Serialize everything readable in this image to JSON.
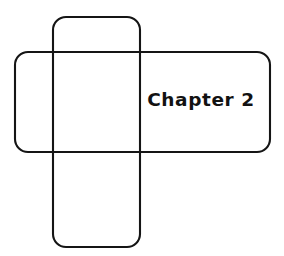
{
  "figure": {
    "title": "Chapter 2",
    "background_color": "#ffffff",
    "stroke_color": "#151515",
    "text_color": "#121212",
    "stroke_width": 2.1,
    "canvas": {
      "width": 284,
      "height": 256
    },
    "label": {
      "text": "Chapter 2",
      "x": 201,
      "y": 100,
      "font_size": 18.5,
      "font_weight": "bold",
      "align": "center"
    },
    "shapes": [
      {
        "name": "vertical-rounded-rectangle",
        "role": "vertical-band",
        "x": 53,
        "y": 17,
        "width": 87,
        "height": 230,
        "corner_radius": 13,
        "fill": "none",
        "stroke": "#151515"
      },
      {
        "name": "horizontal-rounded-rectangle",
        "role": "horizontal-band",
        "x": 15,
        "y": 52,
        "width": 255,
        "height": 100,
        "corner_radius": 13,
        "fill": "none",
        "stroke": "#151515"
      }
    ]
  }
}
